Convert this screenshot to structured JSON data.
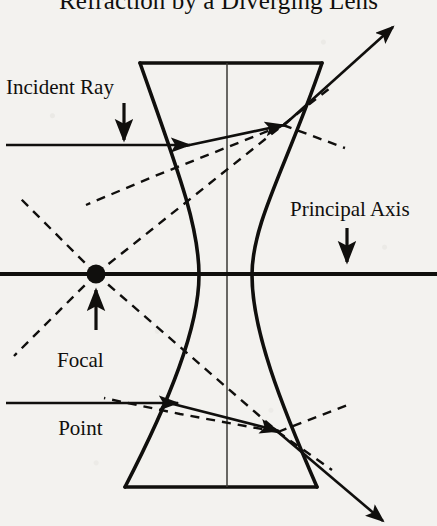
{
  "diagram": {
    "title": "Refraction by a Diverging Lens",
    "labels": {
      "incident_ray": "Incident Ray",
      "principal_axis": "Principal Axis",
      "focal_point_line1": "Focal",
      "focal_point_line2": "Point"
    },
    "colors": {
      "ink": "#100f0d",
      "paper": "#f3f2ef"
    },
    "elements": {
      "lens_name": "biconcave-diverging-lens",
      "focal_point_marker": "focal-point-dot",
      "principal_axis_name": "principal-axis-line",
      "solid_ray_count": 2,
      "dashed_construction_lines": "virtual-ray-extensions"
    },
    "geometry": {
      "lens_top_y": 63,
      "lens_bottom_y": 487,
      "lens_top_left_x": 140,
      "lens_top_right_x": 322,
      "lens_bottom_left_x": 125,
      "lens_bottom_right_x": 317,
      "lens_center_x": 227,
      "lens_waist_left_x": 196,
      "lens_waist_right_x": 252,
      "principal_axis_y": 274,
      "focal_point_x": 96,
      "focal_point_y": 274,
      "upper_ray_y": 145,
      "lower_ray_y": 403,
      "upper_entry_x": 185,
      "upper_exit_x": 283,
      "upper_exit_y": 125,
      "lower_entry_x": 173,
      "lower_exit_x": 278,
      "lower_exit_y": 432
    }
  }
}
